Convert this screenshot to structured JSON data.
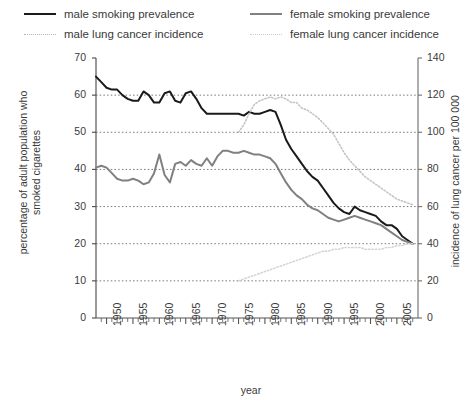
{
  "legend": {
    "items": [
      {
        "id": "male-smoking",
        "label": "male smoking prevalence",
        "style": "solid-dark",
        "color": "#1a1a1a"
      },
      {
        "id": "male-lung",
        "label": "male lung cancer incidence",
        "style": "dot-dark",
        "color": "#b6b6b6"
      },
      {
        "id": "female-smoking",
        "label": "female smoking prevalence",
        "style": "solid-grey",
        "color": "#808080"
      },
      {
        "id": "female-lung",
        "label": "female lung cancer incidence",
        "style": "dot-grey",
        "color": "#cccccc"
      }
    ]
  },
  "axes": {
    "left_title": "percentage of adult population who smoked cigarettes",
    "right_title": "incidence of lung cancer per 100 000",
    "x_title": "year",
    "left_ticks": [
      0,
      10,
      20,
      30,
      40,
      50,
      60,
      70
    ],
    "right_ticks": [
      0,
      20,
      40,
      60,
      80,
      100,
      120,
      140
    ],
    "x_ticks_major": [
      1950,
      1955,
      1960,
      1965,
      1970,
      1975,
      1980,
      1985,
      1990,
      1995,
      2000,
      2005
    ]
  },
  "chart_data": {
    "type": "line",
    "title": "",
    "xlabel": "year",
    "ylabel": "percentage of adult population who smoked cigarettes",
    "y2label": "incidence of lung cancer per 100 000",
    "xlim": [
      1948,
      2009
    ],
    "ylim": [
      0,
      70
    ],
    "y2lim": [
      0,
      140
    ],
    "grid": true,
    "legend_position": "top",
    "series": [
      {
        "name": "male smoking prevalence",
        "axis": "left",
        "style": "solid",
        "color": "#1a1a1a",
        "width": 2,
        "x": [
          1948,
          1949,
          1950,
          1951,
          1952,
          1953,
          1954,
          1955,
          1956,
          1957,
          1958,
          1959,
          1960,
          1961,
          1962,
          1963,
          1964,
          1965,
          1966,
          1967,
          1968,
          1969,
          1970,
          1971,
          1972,
          1973,
          1974,
          1975,
          1976,
          1977,
          1978,
          1979,
          1980,
          1981,
          1982,
          1983,
          1984,
          1985,
          1986,
          1987,
          1988,
          1989,
          1990,
          1991,
          1992,
          1993,
          1994,
          1995,
          1996,
          1997,
          1998,
          1999,
          2000,
          2001,
          2002,
          2003,
          2004,
          2005,
          2006,
          2007,
          2008
        ],
        "y": [
          65.0,
          63.5,
          62.0,
          61.5,
          61.5,
          60.0,
          59.0,
          58.5,
          58.5,
          61.0,
          60.0,
          58.0,
          58.0,
          60.5,
          61.0,
          58.5,
          58.0,
          60.5,
          61.0,
          59.0,
          56.5,
          55.0,
          55.0,
          55.0,
          55.0,
          55.0,
          55.0,
          55.0,
          54.5,
          55.5,
          55.0,
          55.0,
          55.5,
          56.0,
          55.5,
          52.0,
          48.0,
          45.5,
          43.5,
          41.5,
          39.5,
          38.0,
          37.0,
          35.0,
          33.0,
          31.0,
          29.5,
          28.5,
          28.0,
          30.0,
          29.0,
          28.5,
          28.0,
          27.5,
          26.0,
          25.0,
          25.0,
          24.0,
          22.0,
          21.0,
          20.0
        ]
      },
      {
        "name": "female smoking prevalence",
        "axis": "left",
        "style": "solid",
        "color": "#808080",
        "width": 2,
        "x": [
          1948,
          1949,
          1950,
          1951,
          1952,
          1953,
          1954,
          1955,
          1956,
          1957,
          1958,
          1959,
          1960,
          1961,
          1962,
          1963,
          1964,
          1965,
          1966,
          1967,
          1968,
          1969,
          1970,
          1971,
          1972,
          1973,
          1974,
          1975,
          1976,
          1977,
          1978,
          1979,
          1980,
          1981,
          1982,
          1983,
          1984,
          1985,
          1986,
          1987,
          1988,
          1989,
          1990,
          1991,
          1992,
          1993,
          1994,
          1995,
          1996,
          1997,
          1998,
          1999,
          2000,
          2001,
          2002,
          2003,
          2004,
          2005,
          2006,
          2007,
          2008
        ],
        "y": [
          40.5,
          41.0,
          40.5,
          39.0,
          37.5,
          37.0,
          37.0,
          37.5,
          37.0,
          36.0,
          36.5,
          39.0,
          44.0,
          38.5,
          36.5,
          41.5,
          42.0,
          41.0,
          42.5,
          41.5,
          41.0,
          43.0,
          41.0,
          43.5,
          45.0,
          45.0,
          44.5,
          44.5,
          45.0,
          44.5,
          44.0,
          44.0,
          43.5,
          43.0,
          41.5,
          39.0,
          36.5,
          34.5,
          33.0,
          32.0,
          30.5,
          29.5,
          29.0,
          28.0,
          27.0,
          26.5,
          26.0,
          26.5,
          27.0,
          27.5,
          27.0,
          26.5,
          26.0,
          25.5,
          25.0,
          24.0,
          23.0,
          22.0,
          21.0,
          20.5,
          20.0
        ]
      },
      {
        "name": "male lung cancer incidence",
        "axis": "right",
        "style": "dotted",
        "color": "#c4c4c4",
        "width": 1.6,
        "x": [
          1975,
          1976,
          1977,
          1978,
          1979,
          1980,
          1981,
          1982,
          1983,
          1984,
          1985,
          1986,
          1987,
          1988,
          1989,
          1990,
          1991,
          1992,
          1993,
          1994,
          1995,
          1996,
          1997,
          1998,
          1999,
          2000,
          2001,
          2002,
          2003,
          2004,
          2005,
          2006,
          2007,
          2008
        ],
        "y": [
          100,
          104,
          110,
          115,
          117,
          118,
          119,
          118,
          119,
          118,
          116,
          116,
          113,
          112,
          110,
          108,
          105,
          102,
          99,
          94,
          89,
          85,
          82,
          79,
          76,
          74,
          72,
          70,
          68,
          66,
          64,
          63,
          62,
          61
        ]
      },
      {
        "name": "female lung cancer incidence",
        "axis": "right",
        "style": "dotted",
        "color": "#d6d6d6",
        "width": 1.6,
        "x": [
          1975,
          1976,
          1977,
          1978,
          1979,
          1980,
          1981,
          1982,
          1983,
          1984,
          1985,
          1986,
          1987,
          1988,
          1989,
          1990,
          1991,
          1992,
          1993,
          1994,
          1995,
          1996,
          1997,
          1998,
          1999,
          2000,
          2001,
          2002,
          2003,
          2004,
          2005,
          2006,
          2007,
          2008
        ],
        "y": [
          20,
          21,
          22,
          23,
          24,
          25,
          26,
          27,
          28,
          29,
          30,
          31,
          32,
          33,
          34,
          35,
          36,
          36,
          37,
          37,
          38,
          38,
          38,
          38,
          37,
          37,
          37,
          37,
          38,
          38,
          39,
          39,
          40,
          40
        ]
      }
    ]
  }
}
